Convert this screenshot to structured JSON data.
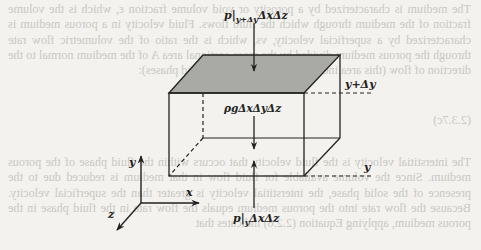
{
  "background_text": {
    "note": "mirrored bleed-through from reverse side of page",
    "paragraph_1": "The medium is characterized by a porosity or void volume fraction ε, which is the volume fraction of the medium through which the fluid flows. Fluid velocity in a porous medium is characterized by a superficial velocity, vs, which is the ratio of the volumetric flow rate through the porous medium divided by the cross-sectional area A of the medium normal to the direction of flow (this area includes both the solid and fluid phases):",
    "equation_label": "(2.3.7c)",
    "paragraph_2": "The interstitial velocity is the fluid velocity that occurs within the fluid phase of the porous medium. Since the volume available for fluid flow in that medium is reduced due to the presence of the solid phase, the interstitial velocity is greater than the superficial velocity. Because the flow rate into the porous medium equals the flow rate in the fluid phase in the porous medium, applying Equation (2.2.6) indicates that"
  },
  "diagram": {
    "top_force_label": "p|y+Δy ΔxΔz",
    "top_force_main": "p|",
    "top_force_sub": "y+Δy",
    "top_force_tail": "ΔxΔz",
    "body_force_label": "ρgΔxΔyΔz",
    "bottom_force_main": "p|",
    "bottom_force_sub": "y",
    "bottom_force_tail": "ΔxΔz",
    "upper_plane_label": "y+Δy",
    "lower_plane_label": "y",
    "axes": {
      "x": "x",
      "y": "y",
      "z": "z"
    },
    "colors": {
      "top_face": "#a9a9a6",
      "lines": "#222222",
      "page": "#f3f2ee"
    }
  }
}
